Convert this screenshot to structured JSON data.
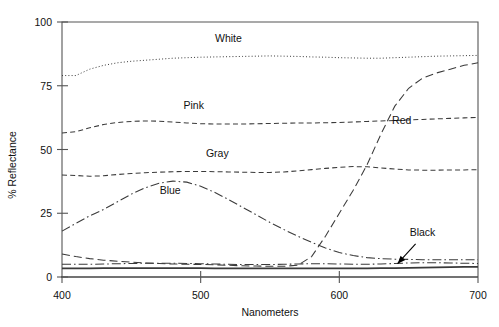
{
  "chart_data": {
    "type": "line",
    "title": "",
    "xlabel": "Nanometers",
    "ylabel": "% Reflectance",
    "xlim": [
      400,
      700
    ],
    "ylim": [
      0,
      100
    ],
    "xticks": [
      400,
      500,
      600,
      700
    ],
    "yticks": [
      0,
      25,
      50,
      75,
      100
    ],
    "grid": false,
    "legend": "inline-labels",
    "x": [
      400,
      410,
      420,
      430,
      440,
      450,
      460,
      470,
      480,
      490,
      500,
      510,
      520,
      530,
      540,
      550,
      560,
      570,
      580,
      590,
      600,
      610,
      620,
      630,
      640,
      650,
      660,
      670,
      680,
      690,
      700
    ],
    "series": [
      {
        "name": "White",
        "label": "White",
        "linestyle": "dotted",
        "label_x": 520,
        "label_y": 92,
        "values": [
          79.0,
          79.0,
          81.5,
          83.0,
          84.0,
          84.6,
          85.0,
          85.4,
          85.8,
          86.0,
          86.2,
          86.3,
          86.4,
          86.5,
          86.6,
          86.7,
          86.6,
          86.5,
          86.3,
          86.2,
          86.0,
          85.9,
          85.8,
          85.8,
          86.0,
          86.2,
          86.4,
          86.6,
          86.7,
          86.8,
          86.9
        ]
      },
      {
        "name": "Pink",
        "label": "Pink",
        "linestyle": "dashed",
        "label_x": 495,
        "label_y": 66,
        "values": [
          56.5,
          57.0,
          58.5,
          59.8,
          60.6,
          61.0,
          61.2,
          61.1,
          60.8,
          60.4,
          60.1,
          60.0,
          60.0,
          60.0,
          60.1,
          60.2,
          60.3,
          60.4,
          60.4,
          60.5,
          60.6,
          60.8,
          61.0,
          61.2,
          61.4,
          61.6,
          61.8,
          62.0,
          62.2,
          62.4,
          62.6
        ]
      },
      {
        "name": "Gray",
        "label": "Gray",
        "linestyle": "dashed",
        "label_x": 512,
        "label_y": 47,
        "values": [
          40.0,
          39.8,
          39.5,
          39.7,
          40.2,
          40.6,
          40.9,
          41.1,
          41.3,
          41.4,
          41.4,
          41.3,
          41.2,
          41.1,
          41.0,
          41.0,
          41.2,
          41.6,
          42.1,
          42.6,
          43.0,
          43.3,
          43.2,
          42.8,
          42.3,
          42.0,
          41.9,
          41.9,
          42.0,
          42.0,
          42.1
        ]
      },
      {
        "name": "Blue",
        "label": "Blue",
        "linestyle": "dashdot",
        "label_x": 478,
        "label_y": 32.5,
        "values": [
          18.0,
          21.0,
          24.0,
          26.5,
          29.5,
          32.5,
          35.0,
          36.8,
          37.6,
          37.2,
          35.6,
          33.2,
          30.4,
          27.4,
          24.4,
          21.4,
          18.6,
          16.0,
          13.6,
          11.4,
          9.6,
          8.4,
          7.6,
          7.2,
          7.0,
          6.9,
          6.8,
          6.8,
          6.8,
          6.8,
          6.8
        ]
      },
      {
        "name": "Red",
        "label": "Red",
        "linestyle": "longdash",
        "label_x": 645,
        "label_y": 60,
        "values": [
          9.0,
          8.0,
          7.2,
          6.6,
          6.2,
          5.8,
          5.5,
          5.3,
          5.1,
          5.0,
          4.9,
          4.8,
          4.6,
          4.4,
          4.3,
          4.2,
          4.2,
          4.6,
          8.0,
          16.0,
          25.0,
          34.0,
          44.0,
          56.0,
          67.0,
          74.0,
          78.0,
          80.0,
          81.5,
          83.0,
          84.0
        ]
      },
      {
        "name": "Black",
        "label": "Black",
        "linestyle": "solid",
        "label_x": 660,
        "label_y": 16,
        "values": [
          3.4,
          3.4,
          3.4,
          3.5,
          3.5,
          3.5,
          3.5,
          3.5,
          3.5,
          3.5,
          3.5,
          3.4,
          3.4,
          3.4,
          3.4,
          3.4,
          3.4,
          3.4,
          3.4,
          3.4,
          3.4,
          3.4,
          3.4,
          3.5,
          3.5,
          3.6,
          3.7,
          3.8,
          3.9,
          4.0,
          4.0
        ]
      },
      {
        "name": "Black-upper",
        "label": "",
        "linestyle": "dashdot",
        "label_x": null,
        "label_y": null,
        "values": [
          5.0,
          5.0,
          5.0,
          5.1,
          5.2,
          5.3,
          5.4,
          5.4,
          5.4,
          5.3,
          5.2,
          5.1,
          5.0,
          4.9,
          4.9,
          4.9,
          5.0,
          5.1,
          5.2,
          5.2,
          5.1,
          5.0,
          5.0,
          5.1,
          5.3,
          5.5,
          5.6,
          5.6,
          5.5,
          5.4,
          5.3
        ]
      }
    ],
    "annotations": [
      {
        "name": "black-arrow",
        "text": "",
        "from_x": 655,
        "from_y": 13,
        "to_x": 642,
        "to_y": 5.2
      }
    ]
  }
}
